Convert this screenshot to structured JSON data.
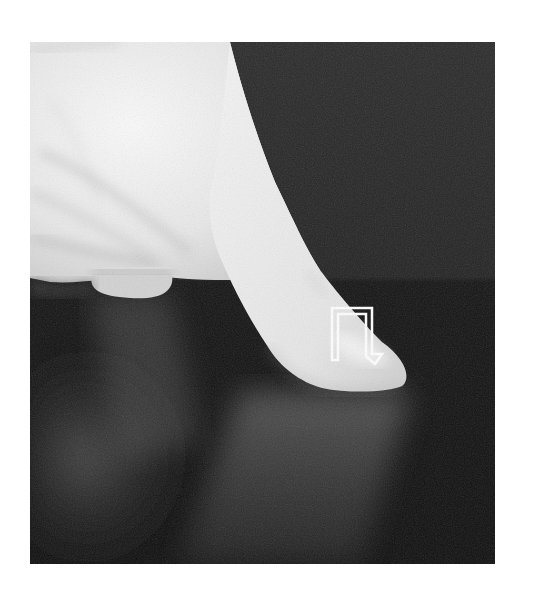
{
  "image": {
    "description": "Grayscale photograph of a finger tapping a dark tabletop, with a white outlined arrow overlay pointing down onto the fingertip",
    "subject": "finger-tap",
    "gesture": "tap",
    "colors": {
      "page_background": "#ffffff",
      "backdrop": "#262626",
      "surface": "#121212",
      "skin_light": "#f2f2f2",
      "skin_shadow": "#bdbdbd",
      "arrow": "#ffffff"
    },
    "overlay": {
      "type": "arrow",
      "style": "outlined",
      "direction": "down",
      "icon": "tap-down-arrow-icon"
    }
  }
}
